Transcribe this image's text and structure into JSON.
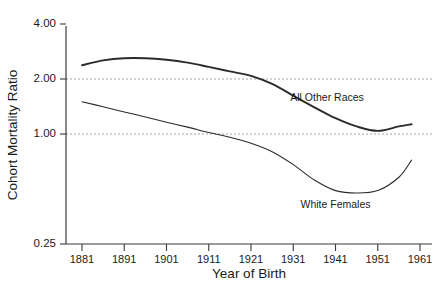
{
  "chart_data": {
    "type": "line",
    "title": "",
    "xlabel": "Year of Birth",
    "ylabel": "Cohort Mortality Ratio",
    "yscale": "log",
    "ylim": [
      0.25,
      4.0
    ],
    "xlim": [
      1881,
      1961
    ],
    "grid": "horizontal dashed reference lines at 1.00 and 2.00",
    "legend_position": "inline annotations next to curves",
    "y_tick_labels": [
      "4.00",
      "2.00",
      "1.00",
      "0.25"
    ],
    "y_tick_values": [
      4.0,
      2.0,
      1.0,
      0.25
    ],
    "gridline_values": [
      2.0,
      1.0
    ],
    "x_tick_labels": [
      "1881",
      "1891",
      "1901",
      "1911",
      "1921",
      "1931",
      "1941",
      "1951",
      "1961"
    ],
    "x_tick_values": [
      1881,
      1891,
      1901,
      1911,
      1921,
      1931,
      1941,
      1951,
      1961
    ],
    "x": [
      1881,
      1886,
      1891,
      1896,
      1901,
      1906,
      1911,
      1916,
      1921,
      1926,
      1931,
      1936,
      1941,
      1946,
      1951,
      1956,
      1959
    ],
    "series": [
      {
        "name": "All Other Races",
        "label_x": 1939,
        "label_y": 1.52,
        "values": [
          2.38,
          2.53,
          2.6,
          2.6,
          2.55,
          2.46,
          2.33,
          2.2,
          2.08,
          1.88,
          1.62,
          1.4,
          1.22,
          1.1,
          1.04,
          1.1,
          1.13
        ]
      },
      {
        "name": "White Females",
        "label_x": 1941,
        "label_y": 0.395,
        "values": [
          1.5,
          1.41,
          1.32,
          1.24,
          1.16,
          1.09,
          1.02,
          0.96,
          0.89,
          0.8,
          0.68,
          0.56,
          0.49,
          0.475,
          0.49,
          0.58,
          0.72
        ]
      }
    ]
  },
  "axes": {
    "y_title": "Cohort Mortality Ratio",
    "x_title": "Year of Birth"
  },
  "colors": {
    "series_line": "#2b2b2b",
    "gridline": "#9a9a9a",
    "axis": "#3a3a3a",
    "background": "#ffffff"
  }
}
